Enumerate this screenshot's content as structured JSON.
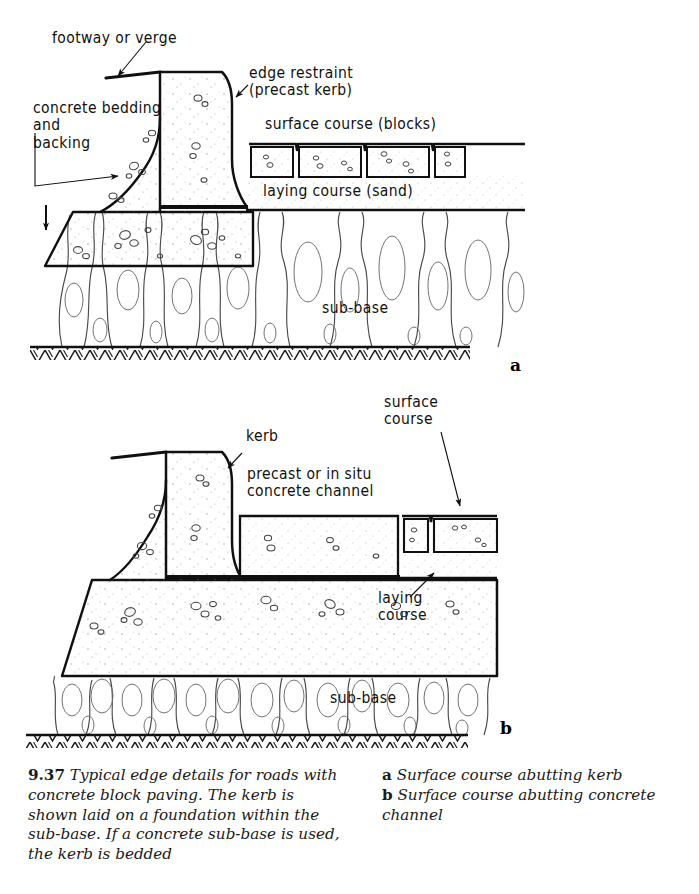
{
  "figure": {
    "number": "9.37",
    "caption_left": "Typical edge details for roads with concrete block paving. The kerb is shown laid on a foundation within the sub-base. If a concrete sub-base is used, the kerb is bedded",
    "caption_right": [
      {
        "letter": "a",
        "text": "Surface course abutting kerb"
      },
      {
        "letter": "b",
        "text": "Surface course abutting concrete channel"
      }
    ]
  },
  "panel_a": {
    "letter": "a",
    "labels": {
      "footway": "footway or verge",
      "bedding": "concrete bedding\nand\nbacking",
      "edge_restraint": "edge restraint\n(precast kerb)",
      "surface_course": "surface course (blocks)",
      "laying_course": "laying course (sand)",
      "sub_base": "sub-base"
    },
    "blocks_count": 4
  },
  "panel_b": {
    "letter": "b",
    "labels": {
      "kerb": "kerb",
      "channel": "precast or in situ\nconcrete channel",
      "surface_course": "surface\ncourse",
      "laying_course": "laying\ncourse",
      "sub_base": "sub-base"
    },
    "blocks_count": 2
  },
  "colors": {
    "ink": "#101010",
    "paper": "#ffffff",
    "hatch": "#3a3a3a",
    "stipple": "#8a8a8a"
  }
}
